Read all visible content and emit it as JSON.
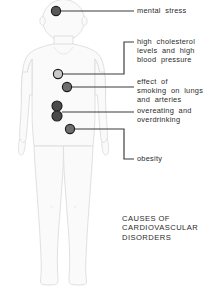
{
  "figure": {
    "title_caption": [
      "CAUSES OF",
      "CARDIOVASCULAR",
      "DISORDERS"
    ],
    "body_fill": "#fafafa",
    "body_stroke": "#d8d8d8",
    "leader_color": "#3a3a3a",
    "text_color": "#2b2b2b",
    "background": "#ffffff"
  },
  "callouts": [
    {
      "id": "mental-stress",
      "lines": [
        "mental  stress"
      ],
      "marker": {
        "cx": 56,
        "cy": 11,
        "r": 4.6,
        "fill": "#595959",
        "stroke": "#1d1d1d"
      },
      "label_x": 137,
      "label_y": 7,
      "leader": "M 60.6 11 L 134 11"
    },
    {
      "id": "high-cholesterol-blood-pressure",
      "lines": [
        "high  cholesterol",
        "levels  and  high",
        "blood  pressure"
      ],
      "marker": {
        "cx": 58,
        "cy": 74,
        "r": 4.6,
        "fill": "#c9c9c9",
        "stroke": "#1d1d1d"
      },
      "label_x": 137,
      "label_y": 38,
      "leader": "M 62.6 74 L 124 74 L 124 42 L 134 42"
    },
    {
      "id": "effect-of-smoking",
      "lines": [
        "effect  of",
        "smoking  on  lungs",
        "and  arteries"
      ],
      "marker": {
        "cx": 67,
        "cy": 87,
        "r": 4.6,
        "fill": "#6e6e6e",
        "stroke": "#1d1d1d"
      },
      "label_x": 137,
      "label_y": 78,
      "leader": "M 71.6 87 L 134 87"
    },
    {
      "id": "overeating-overdrinking",
      "lines": [
        "overeating  and",
        "overdrinking"
      ],
      "marker": {
        "cx": 57,
        "cy": 106,
        "r": 5.0,
        "fill": "#4a4a4a",
        "stroke": "#1d1d1d"
      },
      "marker2": {
        "cx": 57,
        "cy": 116,
        "r": 5.0,
        "fill": "#4a4a4a",
        "stroke": "#1d1d1d"
      },
      "label_x": 137,
      "label_y": 107,
      "leader": "M 62 112 L 134 112"
    },
    {
      "id": "obesity",
      "lines": [
        "obesity"
      ],
      "marker": {
        "cx": 70,
        "cy": 129,
        "r": 4.6,
        "fill": "#6e6e6e",
        "stroke": "#1d1d1d"
      },
      "label_x": 137,
      "label_y": 155,
      "leader": "M 74.6 129 L 124 129 L 124 159 L 134 159"
    }
  ],
  "caption": {
    "x": 122,
    "y": 214,
    "lines": [
      "CAUSES OF",
      "CARDIOVASCULAR",
      "DISORDERS"
    ]
  }
}
